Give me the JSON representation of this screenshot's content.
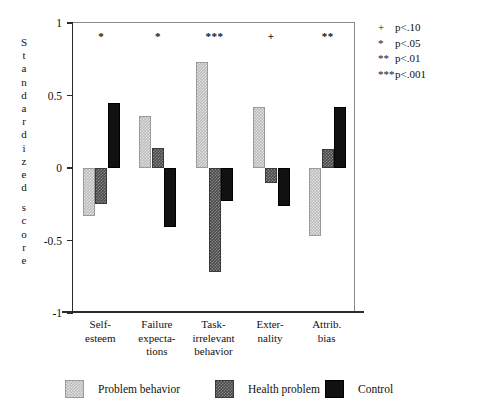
{
  "chart_data": {
    "type": "bar",
    "title": "",
    "subtitle": "",
    "xlabel": "",
    "ylabel": "Standardized score",
    "ylim": [
      -1,
      1
    ],
    "yticks": [
      1,
      0.5,
      0,
      -0.5,
      -1
    ],
    "ytick_labels": [
      "1",
      "0.5",
      "0",
      "-0.5",
      "-1"
    ],
    "grid": false,
    "legend_position": "bottom",
    "categories": [
      "Self-esteem",
      "Failure expectations",
      "Task-irrelevant behavior",
      "Externality",
      "Attrib. bias"
    ],
    "category_label_lines": [
      [
        "Self-",
        "esteem"
      ],
      [
        "Failure",
        "expecta-",
        "tions"
      ],
      [
        "Task-",
        "irrelevant",
        "behavior"
      ],
      [
        "Exter-",
        "nality"
      ],
      [
        "Attrib.",
        "bias"
      ]
    ],
    "series": [
      {
        "name": "Problem behavior",
        "color": "#bcbcbc",
        "values": [
          -0.33,
          0.36,
          0.73,
          0.42,
          -0.47
        ]
      },
      {
        "name": "Health problem",
        "color": "#4a4a4a",
        "values": [
          -0.25,
          0.14,
          -0.72,
          -0.1,
          0.13
        ]
      },
      {
        "name": "Control",
        "color": "#111111",
        "values": [
          0.45,
          -0.41,
          -0.23,
          -0.26,
          0.42
        ]
      }
    ],
    "annotations": [
      {
        "category": "Self-esteem",
        "marker": "*"
      },
      {
        "category": "Failure expectations",
        "marker": "*"
      },
      {
        "category": "Task-irrelevant behavior",
        "marker": "***"
      },
      {
        "category": "Externality",
        "marker": "+"
      },
      {
        "category": "Attrib. bias",
        "marker": "**"
      }
    ],
    "significance_legend": [
      {
        "symbol": "+",
        "text": "p<.10"
      },
      {
        "symbol": "*",
        "text": "p<.05"
      },
      {
        "symbol": "**",
        "text": "p<.01"
      },
      {
        "symbol": "***",
        "text": "p<.001"
      }
    ]
  },
  "ylabel_chars": [
    "S",
    "t",
    "a",
    "n",
    "d",
    "a",
    "r",
    "d",
    "i",
    "z",
    "e",
    "d",
    "",
    "s",
    "c",
    "o",
    "r",
    "e"
  ]
}
